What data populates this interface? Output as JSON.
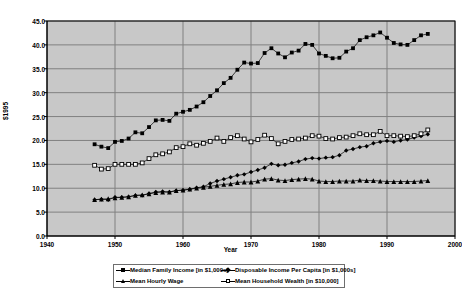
{
  "chart_data": {
    "type": "line",
    "title": "",
    "xlabel": "Year",
    "ylabel": "$1995",
    "xlim": [
      1940,
      2000
    ],
    "ylim": [
      0.0,
      45.0
    ],
    "xticks": [
      "1940",
      "1950",
      "1960",
      "1970",
      "1980",
      "1990",
      "2000"
    ],
    "yticks": [
      "0.0",
      "5.0",
      "10.0",
      "15.0",
      "20.0",
      "25.0",
      "30.0",
      "35.0",
      "40.0",
      "45.0"
    ],
    "grid": true,
    "legend_position": "bottom",
    "plot_background": "#c8c8c8",
    "gridline_color": "#808080",
    "series": [
      {
        "name": "Median Family Income [in $1,000s]",
        "marker": "filled-square",
        "color": "#000000",
        "x": [
          1947,
          1948,
          1949,
          1950,
          1951,
          1952,
          1953,
          1954,
          1955,
          1956,
          1957,
          1958,
          1959,
          1960,
          1961,
          1962,
          1963,
          1964,
          1965,
          1966,
          1967,
          1968,
          1969,
          1970,
          1971,
          1972,
          1973,
          1974,
          1975,
          1976,
          1977,
          1978,
          1979,
          1980,
          1981,
          1982,
          1983,
          1984,
          1985,
          1986,
          1987,
          1988,
          1989,
          1990,
          1991,
          1992,
          1993,
          1994,
          1995,
          1996
        ],
        "values": [
          19.2,
          18.7,
          18.4,
          19.7,
          19.9,
          20.4,
          21.7,
          21.5,
          22.8,
          24.2,
          24.3,
          24.1,
          25.6,
          26.0,
          26.4,
          27.1,
          28.0,
          29.3,
          30.5,
          32.0,
          33.1,
          34.8,
          36.3,
          36.1,
          36.2,
          38.3,
          39.3,
          38.2,
          37.4,
          38.4,
          38.8,
          40.2,
          40.0,
          38.2,
          37.7,
          37.2,
          37.3,
          38.6,
          39.3,
          41.0,
          41.6,
          42.0,
          42.6,
          41.5,
          40.4,
          40.1,
          40.0,
          41.0,
          42.0,
          42.3
        ]
      },
      {
        "name": "Disposable Income Per Capita [in $1,000s]",
        "marker": "filled-diamond",
        "color": "#000000",
        "x": [
          1947,
          1948,
          1949,
          1950,
          1951,
          1952,
          1953,
          1954,
          1955,
          1956,
          1957,
          1958,
          1959,
          1960,
          1961,
          1962,
          1963,
          1964,
          1965,
          1966,
          1967,
          1968,
          1969,
          1970,
          1971,
          1972,
          1973,
          1974,
          1975,
          1976,
          1977,
          1978,
          1979,
          1980,
          1981,
          1982,
          1983,
          1984,
          1985,
          1986,
          1987,
          1988,
          1989,
          1990,
          1991,
          1992,
          1993,
          1994,
          1995,
          1996
        ],
        "values": [
          7.6,
          7.7,
          7.6,
          8.1,
          8.1,
          8.2,
          8.5,
          8.5,
          8.9,
          9.2,
          9.3,
          9.2,
          9.5,
          9.6,
          9.8,
          10.1,
          10.3,
          11.0,
          11.5,
          11.9,
          12.3,
          12.7,
          12.9,
          13.4,
          13.8,
          14.3,
          15.1,
          14.8,
          14.9,
          15.3,
          15.6,
          16.1,
          16.3,
          16.2,
          16.4,
          16.5,
          16.9,
          17.9,
          18.2,
          18.6,
          18.8,
          19.4,
          19.7,
          19.9,
          19.7,
          20.0,
          20.2,
          20.6,
          20.9,
          21.3
        ]
      },
      {
        "name": "Mean Hourly Wage",
        "marker": "filled-triangle",
        "color": "#000000",
        "x": [
          1947,
          1948,
          1949,
          1950,
          1951,
          1952,
          1953,
          1954,
          1955,
          1956,
          1957,
          1958,
          1959,
          1960,
          1961,
          1962,
          1963,
          1964,
          1965,
          1966,
          1967,
          1968,
          1969,
          1970,
          1971,
          1972,
          1973,
          1974,
          1975,
          1976,
          1977,
          1978,
          1979,
          1980,
          1981,
          1982,
          1983,
          1984,
          1985,
          1986,
          1987,
          1988,
          1989,
          1990,
          1991,
          1992,
          1993,
          1994,
          1995,
          1996
        ],
        "values": [
          7.6,
          7.7,
          7.8,
          8.0,
          8.1,
          8.2,
          8.5,
          8.6,
          8.8,
          9.1,
          9.2,
          9.2,
          9.5,
          9.6,
          9.8,
          10.0,
          10.2,
          10.4,
          10.6,
          10.8,
          10.9,
          11.2,
          11.3,
          11.3,
          11.5,
          11.9,
          12.0,
          11.7,
          11.6,
          11.8,
          11.9,
          12.0,
          11.9,
          11.5,
          11.4,
          11.4,
          11.5,
          11.5,
          11.5,
          11.7,
          11.6,
          11.6,
          11.5,
          11.4,
          11.4,
          11.4,
          11.4,
          11.4,
          11.5,
          11.6
        ]
      },
      {
        "name": "Mean Household Wealth [in $10,000]",
        "marker": "open-square",
        "color": "#000000",
        "x": [
          1947,
          1948,
          1949,
          1950,
          1951,
          1952,
          1953,
          1954,
          1955,
          1956,
          1957,
          1958,
          1959,
          1960,
          1961,
          1962,
          1963,
          1964,
          1965,
          1966,
          1967,
          1968,
          1969,
          1970,
          1971,
          1972,
          1973,
          1974,
          1975,
          1976,
          1977,
          1978,
          1979,
          1980,
          1981,
          1982,
          1983,
          1984,
          1985,
          1986,
          1987,
          1988,
          1989,
          1990,
          1991,
          1992,
          1993,
          1994,
          1995,
          1996
        ],
        "values": [
          14.8,
          14.0,
          14.1,
          15.0,
          15.0,
          15.0,
          15.0,
          15.3,
          16.2,
          17.0,
          17.2,
          17.6,
          18.5,
          18.7,
          19.3,
          19.0,
          19.4,
          19.8,
          20.5,
          19.8,
          20.6,
          21.0,
          20.3,
          19.7,
          20.2,
          21.1,
          20.4,
          19.3,
          19.8,
          20.2,
          20.3,
          20.5,
          21.0,
          20.9,
          20.4,
          20.3,
          20.6,
          20.7,
          21.0,
          21.4,
          21.2,
          21.2,
          21.9,
          21.0,
          21.0,
          20.9,
          20.8,
          21.0,
          21.4,
          22.2
        ]
      }
    ]
  }
}
